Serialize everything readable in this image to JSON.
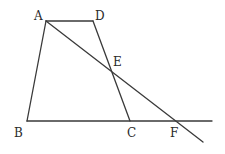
{
  "figure": {
    "type": "geometry",
    "points": {
      "A": {
        "label": "A",
        "x": 46,
        "y": 21
      },
      "D": {
        "label": "D",
        "x": 93,
        "y": 21
      },
      "B": {
        "label": "B",
        "x": 27,
        "y": 121
      },
      "C": {
        "label": "C",
        "x": 130,
        "y": 121
      },
      "E": {
        "label": "E",
        "x": 111,
        "y": 71
      },
      "F": {
        "label": "F",
        "x": 177,
        "y": 121
      }
    },
    "labels": {
      "A": "A",
      "B": "B",
      "C": "C",
      "D": "D",
      "E": "E",
      "F": "F"
    },
    "segments": [
      {
        "name": "AD",
        "from": "A",
        "to": "D"
      },
      {
        "name": "AB",
        "from": "A",
        "to": "B"
      },
      {
        "name": "DC",
        "from": "D",
        "to": "C"
      },
      {
        "name": "BF-extended",
        "from": "B",
        "to": "F"
      },
      {
        "name": "AF-extended",
        "from": "A",
        "to": "F"
      }
    ],
    "colors": {
      "line": "#3a3a3a",
      "text": "#2a2a2a",
      "background": "#ffffff"
    }
  }
}
